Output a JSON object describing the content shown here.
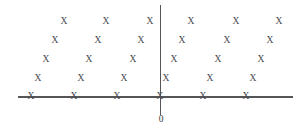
{
  "figure": {
    "title": "",
    "background_color": "#ffffff",
    "width": 307,
    "height": 129
  },
  "axes": {
    "horizontal": {
      "name": "real-axis",
      "label": "",
      "color": "#555558",
      "x_start": 18,
      "x_end": 293,
      "y": 97
    },
    "vertical": {
      "name": "imaginary-axis",
      "label": "",
      "color": "#555558",
      "x": 160,
      "y_start": 5,
      "y_end": 115
    }
  },
  "origin": {
    "label": "0",
    "x": 160,
    "y": 97,
    "label_x": 161,
    "label_y": 120
  },
  "chart_data": {
    "type": "scatter",
    "title": "",
    "xlabel": "",
    "ylabel": "",
    "marker": "x",
    "marker_color": "#4a4a50",
    "marker_size": 9.5,
    "grid": false,
    "legend": null,
    "xlim": [
      18,
      293
    ],
    "ylim": [
      5,
      115
    ],
    "annotations": [
      {
        "text": "0",
        "x": 161,
        "y": 120
      }
    ],
    "rows": [
      {
        "row_index": 0,
        "y": 22,
        "x": [
          64,
          106,
          150,
          191,
          236,
          279
        ]
      },
      {
        "row_index": 1,
        "y": 41,
        "x": [
          55,
          98,
          141,
          182,
          227,
          270
        ]
      },
      {
        "row_index": 2,
        "y": 60,
        "x": [
          46,
          89,
          133,
          174,
          218,
          261
        ]
      },
      {
        "row_index": 3,
        "y": 79,
        "x": [
          38,
          81,
          124,
          166,
          210,
          253
        ]
      },
      {
        "row_index": 4,
        "y": 97,
        "x": [
          31,
          74,
          117,
          160,
          203,
          246
        ]
      }
    ],
    "points": [
      [
        64,
        22
      ],
      [
        106,
        22
      ],
      [
        150,
        22
      ],
      [
        191,
        22
      ],
      [
        236,
        22
      ],
      [
        279,
        22
      ],
      [
        55,
        41
      ],
      [
        98,
        41
      ],
      [
        141,
        41
      ],
      [
        182,
        41
      ],
      [
        227,
        41
      ],
      [
        270,
        41
      ],
      [
        46,
        60
      ],
      [
        89,
        60
      ],
      [
        133,
        60
      ],
      [
        174,
        60
      ],
      [
        218,
        60
      ],
      [
        261,
        60
      ],
      [
        38,
        79
      ],
      [
        81,
        79
      ],
      [
        124,
        79
      ],
      [
        166,
        79
      ],
      [
        210,
        79
      ],
      [
        253,
        79
      ],
      [
        31,
        97
      ],
      [
        74,
        97
      ],
      [
        117,
        97
      ],
      [
        160,
        97
      ],
      [
        203,
        97
      ],
      [
        246,
        97
      ]
    ],
    "point_count": 30,
    "marker_label": "X"
  }
}
